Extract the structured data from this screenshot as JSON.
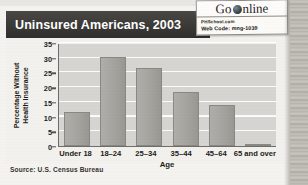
{
  "title": "Uninsured Americans, 2003",
  "badge": {
    "go_label": "Go",
    "online_label": "nline",
    "globe_icon": "globe-icon",
    "site": "PHSchool.com",
    "web_code": "Web Code: mng-1039"
  },
  "source": "Source: U.S. Census Bureau",
  "chart_data": {
    "type": "bar",
    "title": "Uninsured Americans, 2003",
    "categories": [
      "Under 18",
      "18–24",
      "25–34",
      "35–44",
      "45–64",
      "65 and over"
    ],
    "values": [
      11.6,
      30.4,
      26.6,
      18.2,
      13.9,
      0.5
    ],
    "xlabel": "Age",
    "ylabel": "Percentage Without Health Insurance",
    "ylabel_line1": "Percentage Without",
    "ylabel_line2": "Health Insurance",
    "ylim": [
      0,
      35
    ],
    "yticks": [
      0,
      5,
      10,
      15,
      20,
      25,
      30,
      35
    ],
    "ytick_labels": [
      "0",
      "5",
      "10",
      "15",
      "20",
      "25",
      "30",
      "35"
    ],
    "grid": true,
    "legend": "none",
    "bar_color": "#a4a29d",
    "plot_background": "#d6d5d1",
    "gridline_color": "#ffffff",
    "title_bar_color": "#3a3936",
    "title_text_color": "#ffffff"
  }
}
